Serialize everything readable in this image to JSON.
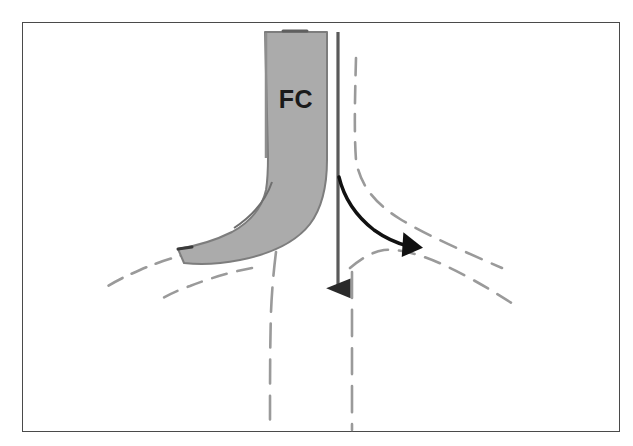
{
  "figure": {
    "title": "",
    "background_color": "#ffffff",
    "frame": {
      "color": "#4a4a4a",
      "x": 22,
      "y": 22,
      "width": 598,
      "height": 410
    },
    "labels": [
      {
        "id": "fc",
        "text": "FC",
        "x": 296,
        "y": 108,
        "color": "#1a1a1a"
      }
    ],
    "colors": {
      "band_fill": "#ababab",
      "band_stroke": "#7d7d7d",
      "dashed_vessel_wall": "#9a9a9a",
      "arrow_main": "#555555",
      "arrow_branch": "#111111",
      "label_text": "#1a1a1a"
    },
    "shapes": {
      "band": {
        "name": "fibrous-cap-band",
        "fill": "#ababab",
        "description": "shaded curved band running from top center down and sweeping to the lower left"
      },
      "main_arrow": {
        "name": "main-flow-arrow",
        "direction": "down",
        "from_x": 338,
        "from_y": 32,
        "to_x": 338,
        "to_y": 300,
        "color": "#555555"
      },
      "branch_arrow": {
        "name": "branch-flow-arrow",
        "direction": "down-right",
        "from_x": 340,
        "from_y": 178,
        "to_x": 422,
        "to_y": 248,
        "color": "#111111"
      },
      "dashed_walls": [
        {
          "name": "wall-left-outer",
          "orientation": "down-left"
        },
        {
          "name": "wall-left-inner",
          "orientation": "down-left"
        },
        {
          "name": "wall-center-left",
          "orientation": "down"
        },
        {
          "name": "wall-center-right",
          "orientation": "down"
        },
        {
          "name": "wall-right-inner",
          "orientation": "down-right"
        },
        {
          "name": "wall-right-outer",
          "orientation": "down-right"
        }
      ]
    }
  }
}
